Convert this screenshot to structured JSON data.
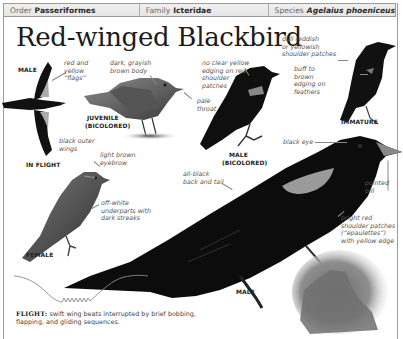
{
  "header": {
    "order_label": "Order",
    "order_value": "Passeriformes",
    "family_label": "Family",
    "family_value": "Icteridae",
    "species_label": "Species",
    "species_value": "Agelaius phoeniceus"
  },
  "title": "Red-winged Blackbird",
  "figures": {
    "male_flight": {
      "label_top": "MALE",
      "label_bottom": "IN FLIGHT",
      "annotations": [
        "red and\nyellow\n“flags”",
        "black outer\nwings"
      ]
    },
    "juvenile": {
      "label_line1": "JUVENILE",
      "label_line2": "(BICOLORED)",
      "annotations": [
        "dark, grayish\nbrown body",
        "pale\nthroat"
      ]
    },
    "male_bicolored": {
      "label_line1": "MALE",
      "label_line2": "(BICOLORED)",
      "annotations": [
        "no clear yellow\nedging on red\nshoulder\npatches"
      ]
    },
    "immature": {
      "label": "IMMATURE",
      "annotations": [
        "dull reddish\nor yellowish\nshoulder patches",
        "buff to\nbrown\nedging on\nfeathers"
      ]
    },
    "female": {
      "label": "FEMALE",
      "annotations": [
        "light brown\neyebrow",
        "off-white\nunderparts with\ndark streaks"
      ]
    },
    "male": {
      "label": "MALE",
      "annotations": [
        "black eye",
        "all-black\nback and tail",
        "pointed\nbill",
        "bright red\nshoulder patches\n(“epaulettes”)\nwith yellow edge"
      ]
    }
  },
  "flight": {
    "label": "FLIGHT:",
    "text": " swift wing beats interrupted by brief bobbing, flapping, and gliding sequences."
  }
}
